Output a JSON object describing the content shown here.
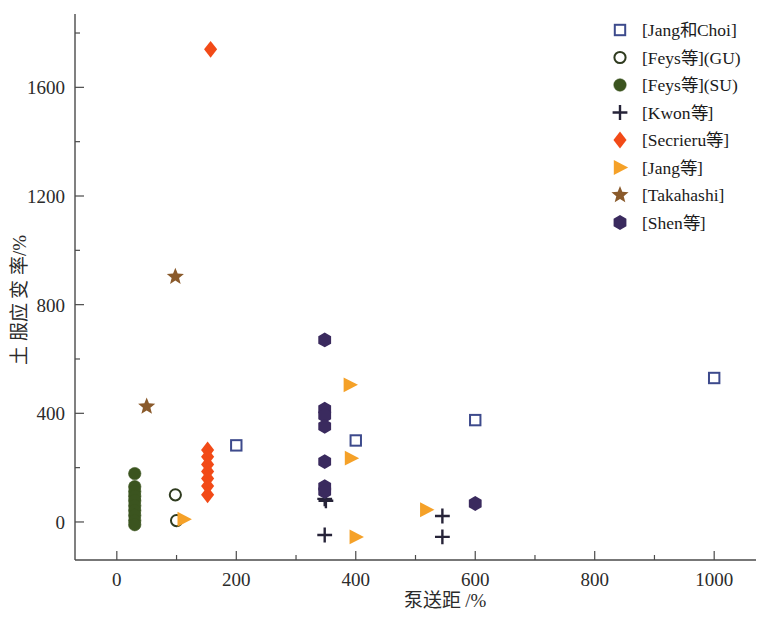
{
  "chart_data": {
    "type": "scatter",
    "title": "",
    "xlabel": "泵送距  /%",
    "ylabel": "土 服应 变 率/%",
    "xlim": [
      -70,
      1070
    ],
    "ylim": [
      -140,
      1870
    ],
    "xticks": [
      0,
      200,
      400,
      600,
      800,
      1000
    ],
    "yticks": [
      0,
      400,
      800,
      1200,
      1600
    ],
    "x_minor_ticks": [
      100,
      300,
      500,
      700,
      900
    ],
    "y_minor_ticks": [
      200,
      600,
      1000,
      1400,
      1800
    ],
    "grid": false,
    "legend_position": "top-right",
    "series": [
      {
        "name": "[Jang和Choi]",
        "marker": "open-square",
        "color": "#3d4a8c",
        "points": [
          {
            "x": 200,
            "y": 282
          },
          {
            "x": 400,
            "y": 300
          },
          {
            "x": 600,
            "y": 375
          },
          {
            "x": 1000,
            "y": 530
          }
        ]
      },
      {
        "name": "[Feys等](GU)",
        "marker": "open-circle",
        "color": "#2f3b1f",
        "points": [
          {
            "x": 98,
            "y": 100
          },
          {
            "x": 100,
            "y": 5
          }
        ]
      },
      {
        "name": "[Feys等](SU)",
        "marker": "filled-circle",
        "color": "#3b541f",
        "points": [
          {
            "x": 30,
            "y": 178
          },
          {
            "x": 30,
            "y": 130
          },
          {
            "x": 30,
            "y": 112
          },
          {
            "x": 30,
            "y": 95
          },
          {
            "x": 30,
            "y": 78
          },
          {
            "x": 30,
            "y": 60
          },
          {
            "x": 30,
            "y": 42
          },
          {
            "x": 30,
            "y": 24
          },
          {
            "x": 30,
            "y": 5
          },
          {
            "x": 30,
            "y": -10
          }
        ]
      },
      {
        "name": "[Kwon等]",
        "marker": "plus",
        "color": "#262338",
        "points": [
          {
            "x": 348,
            "y": 85
          },
          {
            "x": 350,
            "y": 78
          },
          {
            "x": 348,
            "y": -48
          },
          {
            "x": 545,
            "y": 22
          },
          {
            "x": 545,
            "y": -55
          }
        ]
      },
      {
        "name": "[Secrieru等]",
        "marker": "diamond",
        "color": "#f24a17",
        "points": [
          {
            "x": 157,
            "y": 1740
          },
          {
            "x": 152,
            "y": 265
          },
          {
            "x": 152,
            "y": 240
          },
          {
            "x": 152,
            "y": 212
          },
          {
            "x": 152,
            "y": 186
          },
          {
            "x": 152,
            "y": 160
          },
          {
            "x": 152,
            "y": 132
          },
          {
            "x": 152,
            "y": 100
          }
        ]
      },
      {
        "name": "[Jang等]",
        "marker": "right-triangle",
        "color": "#f5a128",
        "points": [
          {
            "x": 112,
            "y": 10
          },
          {
            "x": 390,
            "y": 505
          },
          {
            "x": 392,
            "y": 235
          },
          {
            "x": 400,
            "y": -55
          },
          {
            "x": 518,
            "y": 45
          }
        ]
      },
      {
        "name": "[Takahashi]",
        "marker": "star",
        "color": "#8a5a2b",
        "points": [
          {
            "x": 98,
            "y": 903
          },
          {
            "x": 50,
            "y": 425
          }
        ]
      },
      {
        "name": "[Shen等]",
        "marker": "hexagon",
        "color": "#3a2a5e",
        "points": [
          {
            "x": 348,
            "y": 670
          },
          {
            "x": 348,
            "y": 415
          },
          {
            "x": 348,
            "y": 392
          },
          {
            "x": 348,
            "y": 352
          },
          {
            "x": 348,
            "y": 222
          },
          {
            "x": 348,
            "y": 130
          },
          {
            "x": 348,
            "y": 112
          },
          {
            "x": 600,
            "y": 68
          }
        ]
      }
    ]
  },
  "legend": {
    "items": [
      {
        "label": "[Jang和Choi]",
        "marker": "open-square",
        "color": "#3d4a8c"
      },
      {
        "label": "[Feys等](GU)",
        "marker": "open-circle",
        "color": "#2f3b1f"
      },
      {
        "label": "[Feys等](SU)",
        "marker": "filled-circle",
        "color": "#3b541f"
      },
      {
        "label": "[Kwon等]",
        "marker": "plus",
        "color": "#262338"
      },
      {
        "label": "[Secrieru等]",
        "marker": "diamond",
        "color": "#f24a17"
      },
      {
        "label": "[Jang等]",
        "marker": "right-triangle",
        "color": "#f5a128"
      },
      {
        "label": "[Takahashi]",
        "marker": "star",
        "color": "#8a5a2b"
      },
      {
        "label": "[Shen等]",
        "marker": "hexagon",
        "color": "#3a2a5e"
      }
    ]
  },
  "axes": {
    "x_title": "泵送距  /%",
    "y_title": "土 服应 变 率/%",
    "x_tick_labels": [
      "0",
      "200",
      "400",
      "600",
      "800",
      "1000"
    ],
    "y_tick_labels": [
      "0",
      "400",
      "800",
      "1200",
      "1600"
    ]
  },
  "colors": {
    "axis": "#4a4a4a",
    "background": "#ffffff",
    "jang_choi": "#3d4a8c",
    "feys_gu": "#2f3b1f",
    "feys_su": "#3b541f",
    "kwon": "#262338",
    "secrieru": "#f24a17",
    "jang": "#f5a128",
    "takahashi": "#8a5a2b",
    "shen": "#3a2a5e"
  }
}
